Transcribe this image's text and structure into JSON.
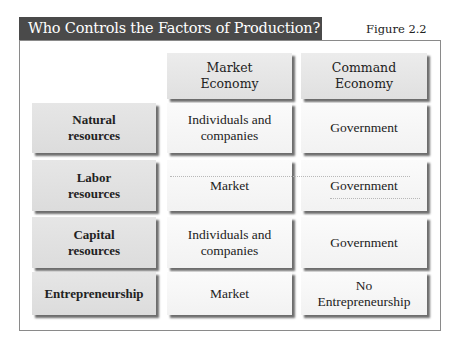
{
  "title": "Who Controls the Factors of Production?",
  "figure_label": "Figure 2.2",
  "columns": [
    {
      "label_line1": "Market",
      "label_line2": "Economy"
    },
    {
      "label_line1": "Command",
      "label_line2": "Economy"
    }
  ],
  "rows": [
    {
      "label_line1": "Natural",
      "label_line2": "resources",
      "market_line1": "Individuals and",
      "market_line2": "companies",
      "command_line1": "Government",
      "command_line2": ""
    },
    {
      "label_line1": "Labor",
      "label_line2": "resources",
      "market_line1": "Market",
      "market_line2": "",
      "command_line1": "Government",
      "command_line2": ""
    },
    {
      "label_line1": "Capital",
      "label_line2": "resources",
      "market_line1": "Individuals and",
      "market_line2": "companies",
      "command_line1": "Government",
      "command_line2": ""
    },
    {
      "label_line1": "Entrepreneurship",
      "label_line2": "",
      "market_line1": "Market",
      "market_line2": "",
      "command_line1": "No",
      "command_line2": "Entrepreneurship"
    }
  ],
  "colors": {
    "title_bar": "#4a4a4a",
    "title_text": "#ffffff",
    "header_cell": "#e4e4e4",
    "row_label_cell": "#e0e0e0",
    "value_cell": "#f6f6f6"
  }
}
